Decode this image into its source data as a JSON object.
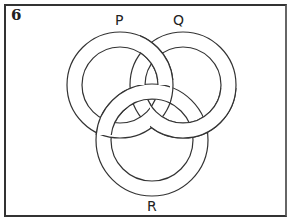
{
  "question_number": "6",
  "labels": {
    "p": "P",
    "q": "Q",
    "r": "R"
  },
  "rings": [
    {
      "name": "P",
      "cx": 120,
      "cy": 85,
      "r_outer": 53,
      "r_inner": 38
    },
    {
      "name": "Q",
      "cx": 183,
      "cy": 85,
      "r_outer": 53,
      "r_inner": 38
    },
    {
      "name": "R",
      "cx": 152,
      "cy": 140,
      "r_outer": 56,
      "r_inner": 41
    }
  ],
  "colors": {
    "stroke": "#333333",
    "fill": "#ffffff",
    "frame": "#333333"
  }
}
